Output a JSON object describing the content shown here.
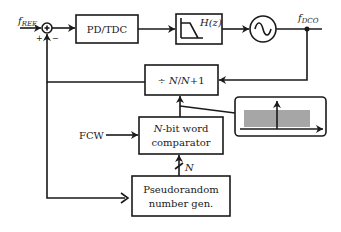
{
  "diagram": {
    "signals": {
      "input": {
        "main": "f",
        "sub": "REF"
      },
      "output": {
        "main": "f",
        "sub": "DCO"
      },
      "fcw": "FCW",
      "bus_width": "N"
    },
    "summing_junction": {
      "plus_label": "+",
      "minus_label": "−"
    },
    "blocks": {
      "pd_tdc": "PD/TDC",
      "loop_filter": "H(z)",
      "dco": "oscillator",
      "divider": {
        "prefix": "÷ ",
        "n1": "N",
        "slash": "/",
        "n2": "N",
        "suffix": "+1"
      },
      "comparator": {
        "line1_it": "N",
        "line1_rest": "-bit word",
        "line2": "comparator"
      },
      "prng": {
        "line1": "Pseudorandom",
        "line2": "number gen."
      }
    },
    "inset": {
      "description": "uniform distribution with threshold",
      "fill_color": "#a6a6a6"
    },
    "colors": {
      "stroke": "#1a1a1a",
      "background": "#ffffff"
    }
  }
}
